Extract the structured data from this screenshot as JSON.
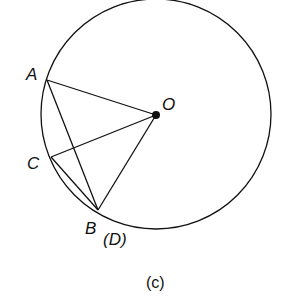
{
  "diagram": {
    "labels": {
      "A": "A",
      "O": "O",
      "C": "C",
      "B": "B",
      "D": "(D)"
    },
    "caption": "(c)",
    "circle": {
      "cx": 156,
      "cy": 114,
      "r": 115
    },
    "points": {
      "A": [
        47,
        80
      ],
      "O": [
        156,
        115
      ],
      "C": [
        51,
        157
      ],
      "B": [
        98,
        210
      ]
    },
    "segments": [
      "AO",
      "AB",
      "CO",
      "CB",
      "OB"
    ]
  }
}
